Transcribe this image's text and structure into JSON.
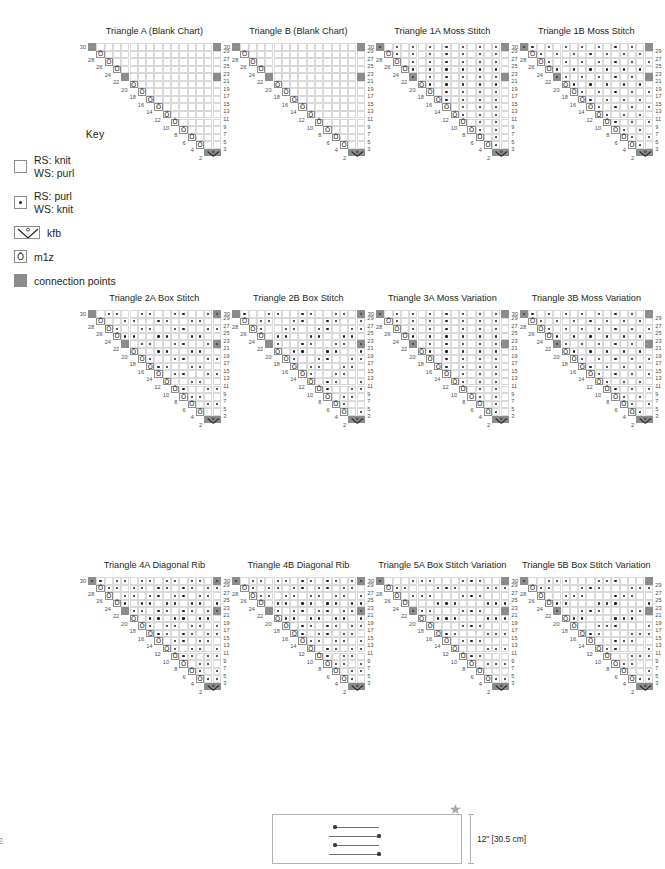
{
  "page": {
    "number": "2"
  },
  "key": {
    "title": "Key",
    "items": [
      {
        "symbol": "knit-square",
        "line1": "RS: knit",
        "line2": "WS: purl"
      },
      {
        "symbol": "purl-dot",
        "line1": "RS: purl",
        "line2": "WS: knit"
      },
      {
        "symbol": "kfb",
        "line1": "kfb",
        "line2": ""
      },
      {
        "symbol": "m1z",
        "line1": "m1z",
        "line2": ""
      },
      {
        "symbol": "connection",
        "line1": "connection points",
        "line2": ""
      }
    ],
    "m1z_glyph": "Ō"
  },
  "charts": [
    {
      "title": "Triangle A (Blank Chart)",
      "pattern": "blank",
      "side": "A"
    },
    {
      "title": "Triangle B (Blank Chart)",
      "pattern": "blank",
      "side": "B"
    },
    {
      "title": "Triangle 1A Moss Stitch",
      "pattern": "moss",
      "side": "A"
    },
    {
      "title": "Triangle 1B Moss Stitch",
      "pattern": "moss",
      "side": "B"
    },
    {
      "title": "Triangle 2A Box Stitch",
      "pattern": "box",
      "side": "A"
    },
    {
      "title": "Triangle 2B Box Stitch",
      "pattern": "box",
      "side": "B"
    },
    {
      "title": "Triangle 3A Moss Variation",
      "pattern": "mossvar",
      "side": "A"
    },
    {
      "title": "Triangle 3B Moss Variation",
      "pattern": "mossvar",
      "side": "B"
    },
    {
      "title": "Triangle 4A Diagonal Rib",
      "pattern": "rib",
      "side": "A"
    },
    {
      "title": "Triangle 4B Diagonal Rib",
      "pattern": "rib",
      "side": "B"
    },
    {
      "title": "Triangle 5A Box Stitch Variation",
      "pattern": "boxvar",
      "side": "A"
    },
    {
      "title": "Triangle 5B Box Stitch Variation",
      "pattern": "boxvar",
      "side": "B"
    }
  ],
  "chart_geometry": {
    "total_rows": 30,
    "top_row_columns": 16,
    "row_numbers_left": [
      30,
      28,
      26,
      24,
      22,
      20,
      18,
      16,
      14,
      12,
      10,
      8,
      6,
      4,
      2
    ],
    "row_numbers_right": [
      29,
      27,
      25,
      23,
      21,
      19,
      17,
      15,
      13,
      11,
      9,
      7,
      5,
      3,
      1
    ],
    "connection_point_rows": [
      30,
      29,
      22,
      21,
      2,
      1
    ],
    "kfb_row": 1,
    "m1z_column_note": "m1z worked at the increase edge of every odd (RS) row"
  },
  "schematic": {
    "width_label": "60\" [152.5 cm]",
    "height_label": "12\" [30.5 cm]",
    "star": "★",
    "arrows": 4
  }
}
